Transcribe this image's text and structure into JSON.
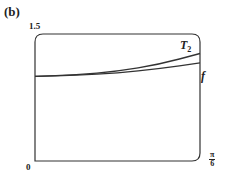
{
  "panel_label": "(b)",
  "axes": {
    "y_max_label": "1.5",
    "origin_label": "0",
    "x_max_numerator": "π",
    "x_max_denominator": "6"
  },
  "curves": {
    "t2_label": "T",
    "t2_sub": "2",
    "f_label": "f"
  },
  "colors": {
    "line": "#333333",
    "background": "#ffffff"
  },
  "chart_data": {
    "type": "line",
    "title": "(b)",
    "xlabel": "",
    "ylabel": "",
    "xlim": [
      0,
      0.5236
    ],
    "ylim": [
      0,
      1.5
    ],
    "x_tick_labels": [
      "0",
      "π/6"
    ],
    "y_tick_labels": [
      "1.5"
    ],
    "grid": false,
    "legend": "inline labels near right end of curves",
    "series": [
      {
        "name": "T2",
        "x": [
          0,
          0.1309,
          0.2618,
          0.3927,
          0.5236
        ],
        "values": [
          1.0,
          1.015,
          1.06,
          1.14,
          1.27
        ]
      },
      {
        "name": "f",
        "x": [
          0,
          0.1309,
          0.2618,
          0.3927,
          0.5236
        ],
        "values": [
          1.0,
          1.01,
          1.04,
          1.09,
          1.16
        ]
      }
    ]
  }
}
